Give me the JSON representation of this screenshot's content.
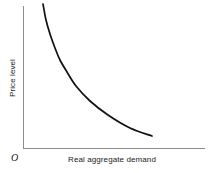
{
  "figure": {
    "background_color": "#ffffff",
    "width": 216,
    "height": 173
  },
  "labels": {
    "x_axis": "Real aggregate demand",
    "y_axis": "Price level",
    "origin": "O"
  },
  "chart_data": {
    "type": "line",
    "title": "",
    "subtitle": "",
    "xlabel": "Real aggregate demand",
    "ylabel": "Price level",
    "origin_label": "O",
    "grid": false,
    "legend": false,
    "legend_position": "none",
    "axis_ticks": {
      "x": [],
      "y": []
    },
    "xlim": [
      0,
      1
    ],
    "ylim": [
      0,
      1
    ],
    "axis_color": "#8c8c8c",
    "curve_color": "#111111",
    "series": [
      {
        "name": "Aggregate demand",
        "shape": "convex-decreasing",
        "x": [
          0.15,
          0.2,
          0.26,
          0.33,
          0.41,
          0.5,
          0.6,
          0.71,
          0.83,
          0.93,
          1.0
        ],
        "y": [
          1.0,
          0.86,
          0.74,
          0.64,
          0.56,
          0.48,
          0.41,
          0.33,
          0.24,
          0.15,
          0.09
        ],
        "points_px": [
          [
            43,
            4
          ],
          [
            46,
            20
          ],
          [
            50,
            34
          ],
          [
            55,
            48
          ],
          [
            60,
            60
          ],
          [
            67,
            72
          ],
          [
            76,
            86
          ],
          [
            90,
            101
          ],
          [
            108,
            115
          ],
          [
            130,
            128
          ],
          [
            152,
            136
          ]
        ]
      }
    ]
  },
  "axes": {
    "y_axis_px": {
      "x": 23,
      "y_top": 6,
      "y_bottom": 148
    },
    "x_axis_px": {
      "y": 148,
      "x_left": 23,
      "x_right": 205
    }
  }
}
